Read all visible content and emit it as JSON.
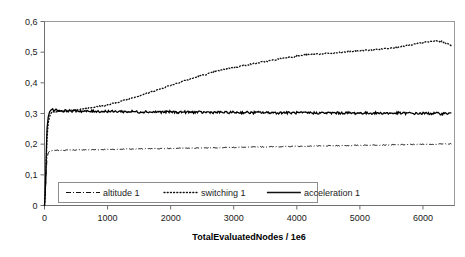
{
  "chart_data": {
    "type": "line",
    "title": "",
    "xlabel": "TotalEvaluatedNodes / 1e6",
    "ylabel": "",
    "xlim": [
      0,
      6500
    ],
    "ylim": [
      0,
      0.6
    ],
    "grid": false,
    "legend_position": "inside-bottom-left",
    "x_ticks": [
      {
        "value": 0,
        "label": "0"
      },
      {
        "value": 1000,
        "label": "1000"
      },
      {
        "value": 2000,
        "label": "2000"
      },
      {
        "value": 3000,
        "label": "3000"
      },
      {
        "value": 4000,
        "label": "4000"
      },
      {
        "value": 5000,
        "label": "5000"
      },
      {
        "value": 6000,
        "label": "6000"
      }
    ],
    "y_ticks": [
      {
        "value": 0,
        "label": "0"
      },
      {
        "value": 0.1,
        "label": "0,1"
      },
      {
        "value": 0.2,
        "label": "0,2"
      },
      {
        "value": 0.3,
        "label": "0,3"
      },
      {
        "value": 0.4,
        "label": "0,4"
      },
      {
        "value": 0.5,
        "label": "0,5"
      },
      {
        "value": 0.6,
        "label": "0,6"
      }
    ],
    "x": [
      0,
      10,
      20,
      30,
      40,
      60,
      80,
      100,
      130,
      160,
      200,
      250,
      300,
      350,
      400,
      450,
      500,
      600,
      700,
      800,
      900,
      1000,
      1100,
      1200,
      1300,
      1400,
      1500,
      1600,
      1700,
      1800,
      1900,
      2000,
      2100,
      2200,
      2300,
      2400,
      2500,
      2600,
      2700,
      2800,
      2900,
      3000,
      3100,
      3200,
      3300,
      3400,
      3500,
      3600,
      3700,
      3800,
      3900,
      4000,
      4100,
      4200,
      4300,
      4400,
      4500,
      4600,
      4700,
      4800,
      4900,
      5000,
      5100,
      5200,
      5300,
      5400,
      5500,
      5600,
      5700,
      5800,
      5900,
      6000,
      6100,
      6200,
      6300,
      6400,
      6450
    ],
    "series": [
      {
        "name": "altitude 1",
        "style": "dash-dot",
        "color": "#111111",
        "values": [
          0,
          0.02,
          0.07,
          0.12,
          0.155,
          0.172,
          0.177,
          0.178,
          0.179,
          0.179,
          0.18,
          0.18,
          0.18,
          0.1805,
          0.181,
          0.181,
          0.181,
          0.1815,
          0.182,
          0.182,
          0.1825,
          0.183,
          0.183,
          0.1835,
          0.184,
          0.184,
          0.1845,
          0.185,
          0.185,
          0.1855,
          0.186,
          0.186,
          0.1865,
          0.187,
          0.187,
          0.1875,
          0.188,
          0.188,
          0.1885,
          0.189,
          0.189,
          0.1895,
          0.19,
          0.19,
          0.1905,
          0.191,
          0.191,
          0.1915,
          0.192,
          0.192,
          0.1925,
          0.193,
          0.193,
          0.1935,
          0.194,
          0.194,
          0.1945,
          0.195,
          0.195,
          0.1955,
          0.196,
          0.196,
          0.1965,
          0.197,
          0.197,
          0.1975,
          0.198,
          0.198,
          0.1985,
          0.199,
          0.199,
          0.1995,
          0.2,
          0.2,
          0.2005,
          0.201,
          0.201
        ]
      },
      {
        "name": "switching 1",
        "style": "dotted",
        "color": "#111111",
        "values": [
          0,
          0.03,
          0.09,
          0.16,
          0.22,
          0.27,
          0.29,
          0.3,
          0.305,
          0.305,
          0.306,
          0.307,
          0.308,
          0.309,
          0.31,
          0.311,
          0.312,
          0.315,
          0.318,
          0.321,
          0.324,
          0.328,
          0.333,
          0.339,
          0.345,
          0.352,
          0.358,
          0.364,
          0.371,
          0.378,
          0.385,
          0.392,
          0.399,
          0.406,
          0.412,
          0.418,
          0.424,
          0.43,
          0.436,
          0.441,
          0.446,
          0.45,
          0.454,
          0.458,
          0.462,
          0.466,
          0.47,
          0.473,
          0.477,
          0.481,
          0.484,
          0.487,
          0.49,
          0.492,
          0.494,
          0.495,
          0.496,
          0.497,
          0.499,
          0.501,
          0.503,
          0.505,
          0.506,
          0.508,
          0.51,
          0.512,
          0.514,
          0.517,
          0.52,
          0.523,
          0.527,
          0.531,
          0.534,
          0.537,
          0.535,
          0.527,
          0.522
        ]
      },
      {
        "name": "acceleration 1",
        "style": "solid",
        "color": "#000000",
        "values": [
          0,
          0.035,
          0.105,
          0.185,
          0.25,
          0.29,
          0.305,
          0.311,
          0.313,
          0.312,
          0.3105,
          0.3095,
          0.308,
          0.3095,
          0.3085,
          0.3075,
          0.309,
          0.3075,
          0.3065,
          0.308,
          0.3065,
          0.3075,
          0.306,
          0.307,
          0.3055,
          0.3065,
          0.305,
          0.306,
          0.3045,
          0.3055,
          0.3045,
          0.3055,
          0.304,
          0.305,
          0.304,
          0.3045,
          0.3035,
          0.3045,
          0.3035,
          0.304,
          0.303,
          0.304,
          0.303,
          0.3035,
          0.3025,
          0.3035,
          0.3025,
          0.303,
          0.302,
          0.303,
          0.302,
          0.3025,
          0.3015,
          0.3025,
          0.3015,
          0.302,
          0.3015,
          0.302,
          0.3015,
          0.302,
          0.301,
          0.3015,
          0.301,
          0.3015,
          0.301,
          0.3015,
          0.3005,
          0.3015,
          0.3005,
          0.301,
          0.3,
          0.3005,
          0.3,
          0.3005,
          0.2995,
          0.3005,
          0.3
        ]
      }
    ],
    "legend": [
      {
        "label": "altitude 1",
        "style": "dash-dot"
      },
      {
        "label": "switching 1",
        "style": "dotted"
      },
      {
        "label": "acceleration 1",
        "style": "solid"
      }
    ]
  }
}
